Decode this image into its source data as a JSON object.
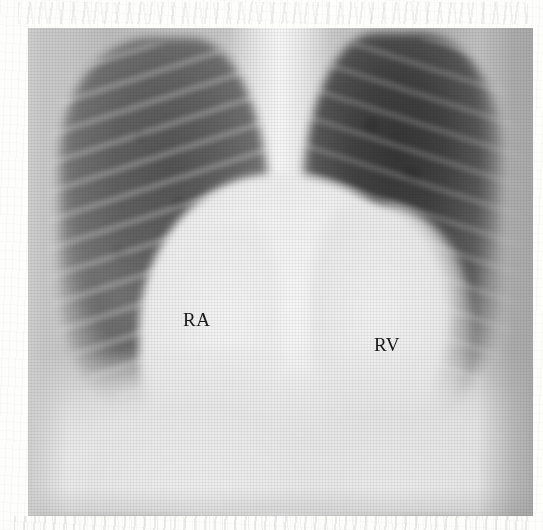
{
  "image": {
    "modality": "chest-radiograph",
    "view": "PA",
    "canvas_width": 543,
    "canvas_height": 530,
    "film_left": 28,
    "film_top": 28,
    "film_width": 505,
    "film_height": 488,
    "background_color": "#fdfdfc",
    "film_base_color": "#c9c9c9"
  },
  "annotations": [
    {
      "id": "ra",
      "text": "RA",
      "meaning": "right atrium",
      "x": 183,
      "y": 310,
      "color": "#171717"
    },
    {
      "id": "rv",
      "text": "RV",
      "meaning": "right ventricle",
      "x": 374,
      "y": 335,
      "color": "#171717"
    }
  ],
  "regions": {
    "lung_right_label": "right lung field",
    "lung_left_label": "left lung field",
    "heart_label": "cardiac silhouette",
    "mediastinum_label": "mediastinum",
    "diaphragm_label": "diaphragm"
  }
}
